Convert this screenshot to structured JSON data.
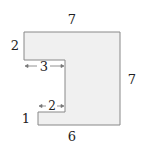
{
  "diagram": {
    "type": "rectilinear-polygon",
    "fill_color": "#f0f0f0",
    "stroke_color": "#888888",
    "vertices": [
      [
        24,
        32
      ],
      [
        120,
        32
      ],
      [
        120,
        125
      ],
      [
        38,
        125
      ],
      [
        38,
        112
      ],
      [
        65,
        112
      ],
      [
        65,
        60
      ],
      [
        24,
        60
      ]
    ],
    "labels": {
      "top": "7",
      "right": "7",
      "bottom": "6",
      "left_top": "2",
      "left_bottom": "1",
      "upper_notch_width": "3",
      "lower_notch_width": "2"
    }
  }
}
